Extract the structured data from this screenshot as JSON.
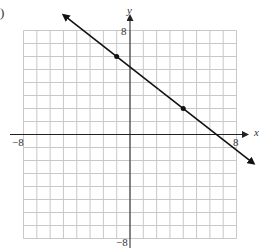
{
  "problem_marker": ")",
  "chart_data": {
    "type": "line",
    "title": "",
    "xlabel": "x",
    "ylabel": "y",
    "xlim": [
      -8,
      8
    ],
    "ylim": [
      -8,
      8
    ],
    "grid": true,
    "tick_labels": {
      "x_min": "−8",
      "x_max": "8",
      "y_min": "−8",
      "y_max": "8"
    },
    "series": [
      {
        "name": "line",
        "equation": "y = -4/5 x + 26/5",
        "points": [
          [
            -1,
            6
          ],
          [
            4,
            2
          ]
        ],
        "arrows_both_ends": true,
        "color": "#111111"
      }
    ]
  },
  "colors": {
    "grid": "#c8c8c8",
    "axis": "#222222",
    "line": "#111111"
  }
}
